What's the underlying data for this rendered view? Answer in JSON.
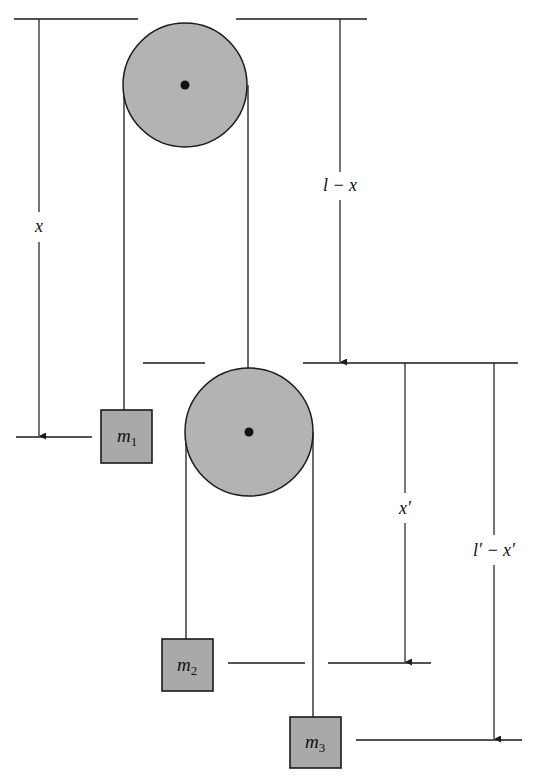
{
  "diagram": {
    "type": "double-atwood-machine",
    "colors": {
      "line": "#1a1a1a",
      "fill": "#b3b3b3",
      "background": "#ffffff"
    },
    "pulleys": [
      {
        "name": "upper",
        "cx": 185,
        "cy": 85,
        "r": 62
      },
      {
        "name": "lower",
        "cx": 249,
        "cy": 432,
        "r": 64
      }
    ],
    "masses": [
      {
        "label": "m",
        "sub": "1",
        "x": 101,
        "y": 410,
        "w": 51,
        "h": 53
      },
      {
        "label": "m",
        "sub": "2",
        "x": 162,
        "y": 639,
        "w": 51,
        "h": 52
      },
      {
        "label": "m",
        "sub": "3",
        "x": 290,
        "y": 717,
        "w": 51,
        "h": 51
      }
    ],
    "dimensions": {
      "x": "x",
      "l_minus_x": "l − x",
      "x_prime": "x′",
      "lp_minus_xp": "l′ − x′"
    }
  }
}
